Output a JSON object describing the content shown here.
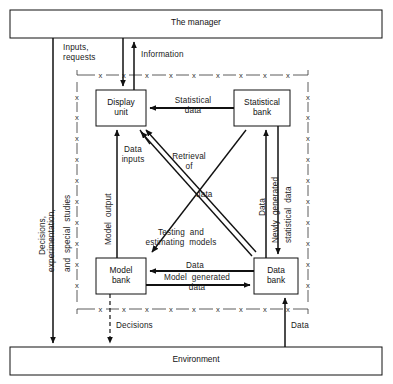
{
  "diagram": {
    "title_top": "The manager",
    "title_bottom": "Environment",
    "type": "flow-diagram",
    "nodes": [
      {
        "id": "manager",
        "label": "The manager",
        "shape": "wide-bar",
        "x": 10,
        "y": 10,
        "w": 372,
        "h": 28
      },
      {
        "id": "environment",
        "label": "Environment",
        "shape": "wide-bar",
        "x": 10,
        "y": 347,
        "w": 372,
        "h": 28
      },
      {
        "id": "display-unit",
        "label": "Display\nunit",
        "shape": "box",
        "x": 96,
        "y": 90,
        "w": 50,
        "h": 36
      },
      {
        "id": "statistical-bank",
        "label": "Statistical\nbank",
        "shape": "box",
        "x": 234,
        "y": 90,
        "w": 56,
        "h": 36
      },
      {
        "id": "model-bank",
        "label": "Model\nbank",
        "shape": "box",
        "x": 96,
        "y": 258,
        "w": 50,
        "h": 36
      },
      {
        "id": "data-bank",
        "label": "Data\nbank",
        "shape": "box",
        "x": 254,
        "y": 258,
        "w": 44,
        "h": 36
      }
    ],
    "edge_labels": [
      {
        "id": "inputs-requests",
        "text": "Inputs,\nrequests",
        "orientation": "horizontal"
      },
      {
        "id": "information",
        "text": "Information",
        "orientation": "horizontal"
      },
      {
        "id": "statistical-data",
        "text": "Statistical\ndata",
        "orientation": "horizontal"
      },
      {
        "id": "data-inputs",
        "text": "Data\ninputs",
        "orientation": "horizontal"
      },
      {
        "id": "retrieval-of-data",
        "text": "Retrieval\nof",
        "orientation": "horizontal"
      },
      {
        "id": "retrieval-data-word",
        "text": "data",
        "orientation": "horizontal"
      },
      {
        "id": "testing-estimating",
        "text": "Testing  and\nestimating  models",
        "orientation": "horizontal"
      },
      {
        "id": "data-horizontal",
        "text": "Data",
        "orientation": "horizontal"
      },
      {
        "id": "model-generated-data",
        "text": "Model  generated\ndata",
        "orientation": "horizontal"
      },
      {
        "id": "decisions-bottom",
        "text": "Decisions",
        "orientation": "horizontal"
      },
      {
        "id": "data-bottom-right",
        "text": "Data",
        "orientation": "horizontal"
      },
      {
        "id": "decisions-experimentation",
        "text": "Decisions,",
        "orientation": "vertical"
      },
      {
        "id": "experimentation-line",
        "text": "experimentation,",
        "orientation": "vertical"
      },
      {
        "id": "special-studies-line",
        "text": "and  special  studies",
        "orientation": "vertical"
      },
      {
        "id": "model-output",
        "text": "Model  output",
        "orientation": "vertical"
      },
      {
        "id": "data-vertical-right",
        "text": "Data",
        "orientation": "vertical"
      },
      {
        "id": "newly-generated",
        "text": "Newly  generated",
        "orientation": "vertical"
      },
      {
        "id": "statistical-data-vert",
        "text": "statistical  data",
        "orientation": "vertical"
      }
    ],
    "boundary": {
      "style": "x-dashed",
      "marker": "x",
      "left": 77,
      "right": 308,
      "top": 75,
      "bottom": 309
    },
    "colors": {
      "stroke": "#111111",
      "text": "#1a1a1a",
      "background": "#ffffff"
    }
  }
}
